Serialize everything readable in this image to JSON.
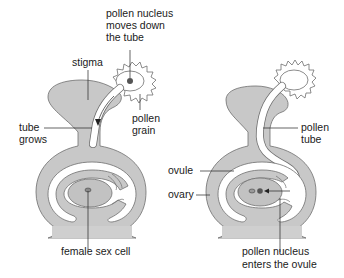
{
  "colors": {
    "tissue": "#c8c8c8",
    "tissue_stroke": "#6e6e6e",
    "white": "#ffffff",
    "ovule": "#bdbdbd",
    "nucleus": "#6a6a6a",
    "label_line": "#222222",
    "text": "#1a1a1a"
  },
  "left_diagram": {
    "labels": {
      "pollen_nucleus_line1": "pollen nucleus",
      "pollen_nucleus_line2": "moves down",
      "pollen_nucleus_line3": "the tube",
      "stigma": "stigma",
      "pollen_grain_line1": "pollen",
      "pollen_grain_line2": "grain",
      "tube_grows_line1": "tube",
      "tube_grows_line2": "grows",
      "female_sex_cell": "female sex cell"
    }
  },
  "right_diagram": {
    "labels": {
      "pollen_tube_line1": "pollen",
      "pollen_tube_line2": "tube",
      "ovule": "ovule",
      "ovary": "ovary",
      "pollen_nucleus_enters_line1": "pollen nucleus",
      "pollen_nucleus_enters_line2": "enters the ovule"
    }
  }
}
